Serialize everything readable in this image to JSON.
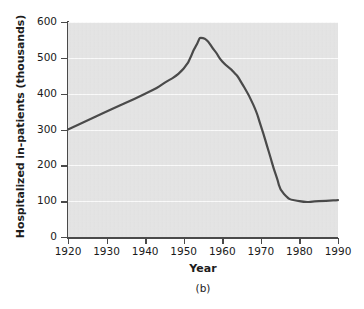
{
  "figure": {
    "panel_caption": "(b)"
  },
  "chart_data": {
    "type": "line",
    "title": "",
    "xlabel": "Year",
    "ylabel": "Hospitalized in-patients (thousands)",
    "xlim": [
      1920,
      1990
    ],
    "ylim": [
      0,
      600
    ],
    "grid": true,
    "legend": null,
    "xticks": [
      1920,
      1930,
      1940,
      1950,
      1960,
      1970,
      1980,
      1990
    ],
    "xtick_labels": [
      "1920",
      "1930",
      "1940",
      "1950",
      "1960",
      "1970",
      "1980",
      "1990"
    ],
    "yticks": [
      0,
      100,
      200,
      300,
      400,
      500,
      600
    ],
    "ytick_labels": [
      "0",
      "100",
      "200",
      "300",
      "400",
      "500",
      "600"
    ],
    "line_color": "#4a4a4a",
    "plot_background": "#e4e4e4",
    "gridline_color": "#fbfbfb",
    "x": [
      1920,
      1930,
      1940,
      1945,
      1950,
      1953,
      1955,
      1958,
      1960,
      1963,
      1965,
      1968,
      1970,
      1972,
      1974,
      1976,
      1980,
      1985,
      1990
    ],
    "values": [
      300,
      350,
      400,
      430,
      470,
      530,
      555,
      520,
      490,
      460,
      430,
      370,
      310,
      240,
      170,
      120,
      100,
      100,
      103
    ],
    "series": [
      {
        "name": "Hospitalized in-patients",
        "values": [
          300,
          350,
          400,
          430,
          470,
          530,
          555,
          520,
          490,
          460,
          430,
          370,
          310,
          240,
          170,
          120,
          100,
          100,
          103
        ]
      }
    ],
    "annotations": []
  }
}
